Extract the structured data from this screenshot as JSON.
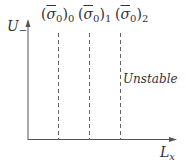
{
  "diagram": {
    "y_axis_label": "U",
    "y_axis_label_subscript": "−",
    "x_axis_label": "L",
    "x_axis_label_subscript": "x",
    "region_label": "Unstable",
    "threshold_lines": [
      {
        "symbol": "σ",
        "subscript": "0",
        "outer_subscript": "0"
      },
      {
        "symbol": "σ",
        "subscript": "0",
        "outer_subscript": "1"
      },
      {
        "symbol": "σ",
        "subscript": "0",
        "outer_subscript": "2"
      }
    ]
  },
  "colors": {
    "axis": "#555555",
    "dashed": "#666666",
    "text": "#333333"
  }
}
